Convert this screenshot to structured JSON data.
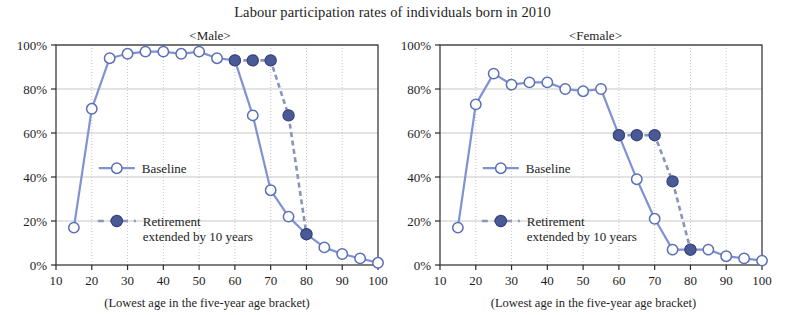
{
  "figure": {
    "title": "Labour participation rates of individuals born in 2010",
    "axis_caption": "(Lowest age in the five-year age bracket)",
    "colors": {
      "baseline_line": "#7f93d2",
      "baseline_marker_fill": "#ffffff",
      "baseline_marker_stroke": "#5b6fb5",
      "retirement_line": "#8a93b8",
      "retirement_marker_fill": "#4a5a96",
      "retirement_marker_stroke": "#36427a",
      "axis": "#2b2b2b",
      "grid": "#b9b9b9",
      "text": "#1d1d1d"
    }
  },
  "legend": {
    "baseline_label": "Baseline",
    "retirement_label_line1": "Retirement",
    "retirement_label_line2": "extended by 10 years"
  },
  "chart_data": [
    {
      "type": "line",
      "panel": "male",
      "title": "<Male>",
      "xlabel": "(Lowest age in the five-year age bracket)",
      "ylabel": "",
      "xlim": [
        10,
        100
      ],
      "ylim": [
        0,
        100
      ],
      "xticks": [
        10,
        20,
        30,
        40,
        50,
        60,
        70,
        80,
        90,
        100
      ],
      "yticks": [
        0,
        20,
        40,
        60,
        80,
        100
      ],
      "ytick_labels": [
        "0%",
        "20%",
        "40%",
        "60%",
        "80%",
        "100%"
      ],
      "xtick_labels": [
        "10",
        "20",
        "30",
        "40",
        "50",
        "60",
        "70",
        "80",
        "90",
        "100"
      ],
      "grid": true,
      "legend_position": "center-left",
      "x": [
        15,
        20,
        25,
        30,
        35,
        40,
        45,
        50,
        55,
        60,
        65,
        70,
        75,
        80,
        85,
        90,
        95,
        100
      ],
      "series": [
        {
          "name": "Baseline",
          "values": [
            17,
            71,
            94,
            96,
            97,
            97,
            96,
            97,
            94,
            93,
            68,
            34,
            22,
            14,
            8,
            5,
            3,
            1
          ]
        },
        {
          "name": "Retirement extended by 10 years",
          "x": [
            60,
            65,
            70,
            75,
            80
          ],
          "values": [
            93,
            93,
            93,
            68,
            14
          ]
        }
      ]
    },
    {
      "type": "line",
      "panel": "female",
      "title": "<Female>",
      "xlabel": "(Lowest age in the five-year age bracket)",
      "ylabel": "",
      "xlim": [
        10,
        100
      ],
      "ylim": [
        0,
        100
      ],
      "xticks": [
        10,
        20,
        30,
        40,
        50,
        60,
        70,
        80,
        90,
        100
      ],
      "yticks": [
        0,
        20,
        40,
        60,
        80,
        100
      ],
      "ytick_labels": [
        "0%",
        "20%",
        "40%",
        "60%",
        "80%",
        "100%"
      ],
      "xtick_labels": [
        "10",
        "20",
        "30",
        "40",
        "50",
        "60",
        "70",
        "80",
        "90",
        "100"
      ],
      "grid": true,
      "legend_position": "center-left",
      "x": [
        15,
        20,
        25,
        30,
        35,
        40,
        45,
        50,
        55,
        60,
        65,
        70,
        75,
        80,
        85,
        90,
        95,
        100
      ],
      "series": [
        {
          "name": "Baseline",
          "values": [
            17,
            73,
            87,
            82,
            83,
            83,
            80,
            79,
            80,
            59,
            39,
            21,
            7,
            7,
            7,
            4,
            3,
            2
          ]
        },
        {
          "name": "Retirement extended by 10 years",
          "x": [
            60,
            65,
            70,
            75,
            80
          ],
          "values": [
            59,
            59,
            59,
            38,
            7
          ]
        }
      ]
    }
  ]
}
